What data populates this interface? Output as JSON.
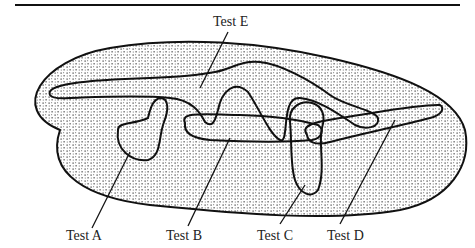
{
  "diagram": {
    "type": "venn-like region diagram",
    "universe": {
      "name": "population",
      "fill": "stippled"
    },
    "labels": [
      {
        "id": "A",
        "text": "Test A"
      },
      {
        "id": "B",
        "text": "Test B"
      },
      {
        "id": "C",
        "text": "Test C"
      },
      {
        "id": "D",
        "text": "Test D"
      },
      {
        "id": "E",
        "text": "Test E"
      }
    ]
  },
  "colors": {
    "line": "#111111",
    "background": "#ffffff",
    "dots": "#333333"
  }
}
